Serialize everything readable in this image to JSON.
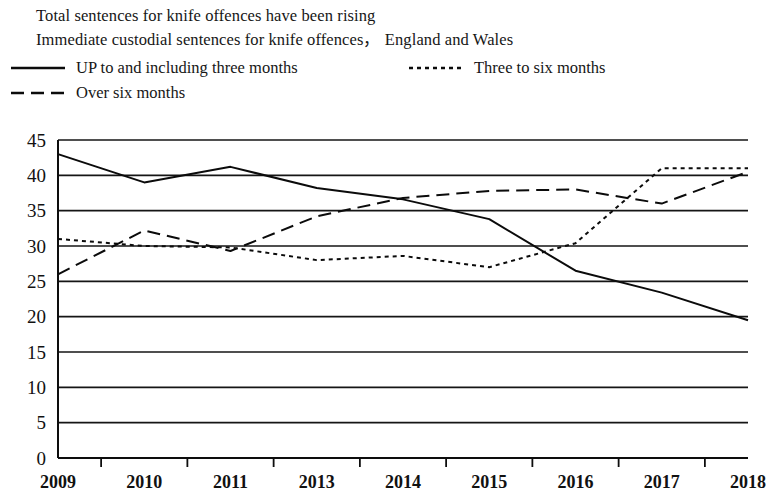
{
  "titles": {
    "line1": "Total sentences for knife offences have been rising",
    "line2": "Immediate custodial sentences for knife offences， England and Wales"
  },
  "legend": {
    "items": [
      {
        "label": "UP to and including three months",
        "style": "solid",
        "key": "solid-line-key"
      },
      {
        "label": "Three to six months",
        "style": "dotted",
        "key": "dotted-line-key"
      },
      {
        "label": "Over six months",
        "style": "dashed",
        "key": "dashed-line-key"
      }
    ]
  },
  "chart_data": {
    "type": "line",
    "title": "Total sentences for knife offences have been rising",
    "subtitle": "Immediate custodial sentences for knife offences， England and Wales",
    "xlabel": "",
    "ylabel": "",
    "ylim": [
      0,
      45
    ],
    "yticks": [
      0,
      5,
      10,
      15,
      20,
      25,
      30,
      35,
      40,
      45
    ],
    "grid": true,
    "legend_position": "top-left",
    "categories": [
      "2009",
      "2010",
      "2011",
      "2013",
      "2014",
      "2015",
      "2016",
      "2017",
      "2018"
    ],
    "x": [
      "2009",
      "2010",
      "2011",
      "2013",
      "2014",
      "2015",
      "2016",
      "2017",
      "2018"
    ],
    "series": [
      {
        "name": "UP to and including three months",
        "style": "solid",
        "values": [
          43.0,
          39.0,
          41.2,
          38.2,
          36.6,
          33.8,
          26.5,
          23.4,
          19.5
        ]
      },
      {
        "name": "Three to six months",
        "style": "dotted",
        "values": [
          31.0,
          30.0,
          29.8,
          28.0,
          28.6,
          27.0,
          30.4,
          41.0,
          41.0
        ]
      },
      {
        "name": "Over six months",
        "style": "dashed",
        "values": [
          26.0,
          32.2,
          29.3,
          34.2,
          36.8,
          37.8,
          38.0,
          36.0,
          40.5
        ]
      }
    ]
  },
  "axis": {
    "y_tick_labels": [
      "45",
      "40",
      "35",
      "30",
      "25",
      "20",
      "15",
      "10",
      "5",
      "0"
    ],
    "x_tick_labels": [
      "2009",
      "2010",
      "2011",
      "2013",
      "2014",
      "2015",
      "2016",
      "2017",
      "2018"
    ]
  }
}
